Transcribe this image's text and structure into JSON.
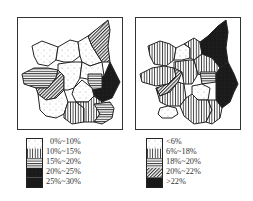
{
  "maps": [
    {
      "id": "left",
      "legend": {
        "classes": [
          {
            "label": "0%~10%",
            "pattern": "dotted"
          },
          {
            "label": "10%~15%",
            "pattern": "vertical-lines"
          },
          {
            "label": "15%~20%",
            "pattern": "horizontal-lines"
          },
          {
            "label": "20%~25%",
            "pattern": "diagonal-lines"
          },
          {
            "label": "25%~30%",
            "pattern": "solid-black"
          }
        ]
      }
    },
    {
      "id": "right",
      "legend": {
        "classes": [
          {
            "label": "<6%",
            "pattern": "dotted"
          },
          {
            "label": "6%~18%",
            "pattern": "vertical-lines"
          },
          {
            "label": "18%~20%",
            "pattern": "horizontal-lines"
          },
          {
            "label": "20%~22%",
            "pattern": "diagonal-lines"
          },
          {
            "label": ">22%",
            "pattern": "solid-black"
          }
        ]
      }
    }
  ],
  "colors": {
    "ink": "#222222",
    "paper": "#ffffff"
  }
}
